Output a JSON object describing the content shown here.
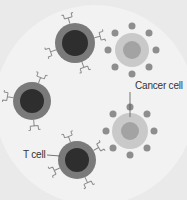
{
  "diagram": {
    "labels": {
      "cancer_cell": "Cancer cell",
      "t_cell": "T cell"
    },
    "colors": {
      "background": "#eaeaea",
      "field": "#f2f2f2",
      "t_cell_outer": "#7a7a7a",
      "t_cell_inner": "#2e2e2e",
      "cancer_body": "#c9c9c9",
      "cancer_nucleus": "#a3a3a3",
      "cancer_spike": "#8e8e8e",
      "receptor": "#8a8a8a"
    },
    "t_cells": [
      {
        "cx": 75,
        "cy": 43
      },
      {
        "cx": 32,
        "cy": 101
      },
      {
        "cx": 77,
        "cy": 160
      }
    ],
    "cancer_cells": [
      {
        "cx": 132,
        "cy": 50
      },
      {
        "cx": 130,
        "cy": 131
      }
    ]
  }
}
